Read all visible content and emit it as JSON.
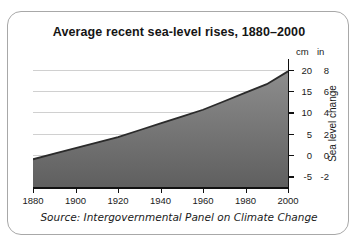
{
  "card": {
    "title": "Average recent sea-level rises, 1880–2000",
    "source": "Source: Intergovernmental Panel on Climate Change"
  },
  "axis": {
    "unit_left": "cm",
    "unit_right": "in",
    "y_label": "Sea level change"
  },
  "colors": {
    "background": "#ffffff",
    "border": "#a8a8a8",
    "text": "#151515",
    "gridline": "#d0d0d0",
    "axis": "#111111",
    "area_top": "#8d8d8d",
    "area_bottom": "#5f5f5f",
    "curve": "#2b2b2b"
  },
  "chart_data": {
    "type": "area",
    "title": "Average recent sea-level rises, 1880–2000",
    "xlabel": "",
    "ylabel": "Sea level change",
    "grid": true,
    "legend": false,
    "source": "Source: Intergovernmental Panel on Climate Change",
    "xlim": [
      1880,
      2000
    ],
    "xticks": [
      1880,
      1900,
      1920,
      1940,
      1960,
      1980,
      2000
    ],
    "xticklabels": [
      "1880",
      "1900",
      "1920",
      "1940",
      "1960",
      "1980",
      "2000"
    ],
    "ylim": [
      -7.5,
      22.5
    ],
    "yticks_cm": [
      20,
      15,
      10,
      5,
      0,
      -5
    ],
    "yticklabels_cm": [
      "20",
      "15",
      "10",
      "5",
      "0",
      "-5"
    ],
    "yticks_in": [
      8,
      6,
      4,
      2,
      0,
      -2
    ],
    "yticklabels_in": [
      "8",
      "6",
      "4",
      "2",
      "0",
      "-2"
    ],
    "y_unit_primary": "cm",
    "y_unit_secondary": "in",
    "x": [
      1880,
      1890,
      1900,
      1910,
      1920,
      1930,
      1940,
      1950,
      1960,
      1970,
      1980,
      1990,
      2000
    ],
    "values": [
      -1.0,
      0.3,
      1.6,
      2.9,
      4.2,
      5.8,
      7.4,
      9.0,
      10.6,
      12.6,
      14.6,
      16.6,
      19.6
    ]
  }
}
